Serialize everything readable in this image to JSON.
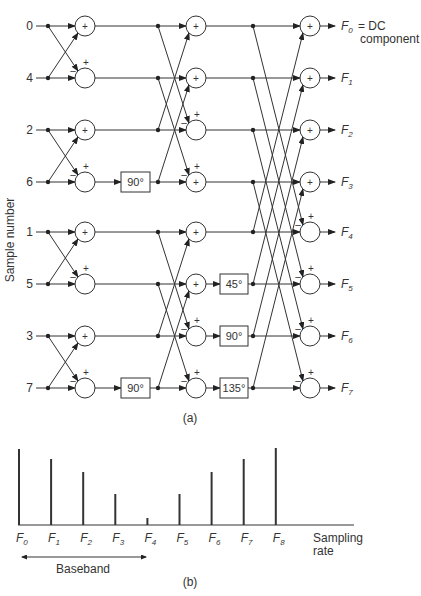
{
  "diagram": {
    "y_axis_label": "Sample number",
    "caption_a": "(a)",
    "caption_b": "(b)",
    "inputs": [
      "0",
      "4",
      "2",
      "6",
      "1",
      "5",
      "3",
      "7"
    ],
    "outputs": [
      {
        "label": "F",
        "sub": "0"
      },
      {
        "label": "F",
        "sub": "1"
      },
      {
        "label": "F",
        "sub": "2"
      },
      {
        "label": "F",
        "sub": "3"
      },
      {
        "label": "F",
        "sub": "4"
      },
      {
        "label": "F",
        "sub": "5"
      },
      {
        "label": "F",
        "sub": "6"
      },
      {
        "label": "F",
        "sub": "7"
      }
    ],
    "dc_note_line1": "= DC",
    "dc_note_line2": "component",
    "stage1_twiddles": [
      {
        "row": 3,
        "label": "90°"
      },
      {
        "row": 7,
        "label": "90°"
      }
    ],
    "stage3_twiddles": [
      {
        "row": 5,
        "label": "45°"
      },
      {
        "row": 6,
        "label": "90°"
      },
      {
        "row": 7,
        "label": "135°"
      }
    ],
    "plus_sign": "+",
    "minus_sign": "–"
  },
  "spectrum": {
    "baseband_label": "Baseband",
    "sampling_label_line1": "Sampling",
    "sampling_label_line2": "rate"
  },
  "chart_data": {
    "type": "bar",
    "title": "",
    "categories": [
      "F0",
      "F1",
      "F2",
      "F3",
      "F4",
      "F5",
      "F6",
      "F7",
      "F8"
    ],
    "values": [
      76,
      66,
      53,
      31,
      7,
      31,
      53,
      66,
      77
    ],
    "xlabel": "Sampling rate",
    "ylabel": "",
    "annotations": [
      "Baseband (F0 to F4)"
    ],
    "grid": false
  }
}
